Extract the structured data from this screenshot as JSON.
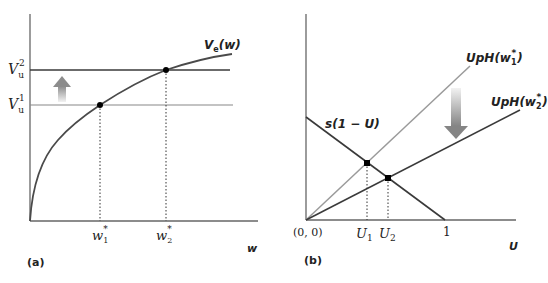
{
  "panel_a": {
    "label": "(a)",
    "x_axis_label": "w",
    "curve_label_main": "V",
    "curve_label_sub": "e",
    "curve_label_arg": "(w)",
    "vu2_main": "V",
    "vu2_sub": "u",
    "vu2_sup": "2",
    "vu1_main": "V",
    "vu1_sub": "u",
    "vu1_sup": "1",
    "w1_main": "w",
    "w1_sub": "1",
    "w1_sup": "*",
    "w2_main": "w",
    "w2_sub": "2",
    "w2_sup": "*",
    "arrow_direction": "up"
  },
  "panel_b": {
    "label": "(b)",
    "x_axis_label": "U",
    "origin_label": "(0, 0)",
    "u1_main": "U",
    "u1_sub": "1",
    "u2_main": "U",
    "u2_sub": "2",
    "one_label": "1",
    "s_line_label": "s(1 − U)",
    "uph1_main": "UpH(w",
    "uph1_sub": "1",
    "uph1_sup": "*",
    "uph1_close": ")",
    "uph2_main": "UpH(w",
    "uph2_sub": "2",
    "uph2_sup": "*",
    "uph2_close": ")",
    "arrow_direction": "down"
  },
  "colors": {
    "axis": "#555555",
    "dark_line": "#3a3a3a",
    "light_line": "#9a9a9a",
    "arrow_top": "#e6e6e6",
    "arrow_bottom": "#8a8a8a",
    "point": "#000000"
  }
}
